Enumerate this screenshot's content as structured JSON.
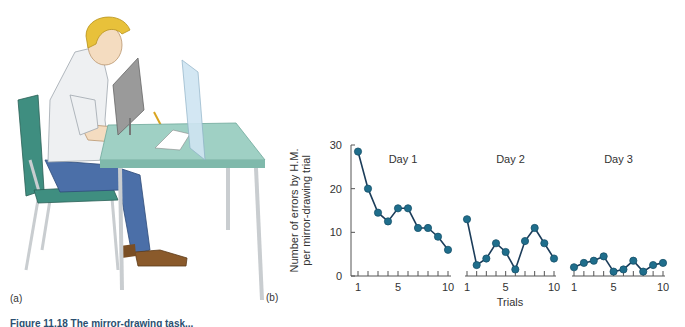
{
  "panels": {
    "a_label": "(a)",
    "b_label": "(b)"
  },
  "illustration": {
    "description": "Man seated at a table performing a mirror-drawing task behind a screen",
    "colors": {
      "table": "#9fd0c4",
      "table_edge": "#7fb9ab",
      "chair": "#3f8e80",
      "shirt": "#eef0f2",
      "pants": "#4b6fa8",
      "hair": "#e8c13a",
      "skin": "#f4dcc0",
      "shoes": "#8a5a2b",
      "screen": "#9a9a9a",
      "mirror": "#cfe5f2",
      "legs": "#c9cdd0"
    }
  },
  "chart_data": {
    "type": "line",
    "title": "",
    "xlabel": "Trials",
    "ylabel": "Number of errors by H.M. per mirror-drawing trial",
    "ylabel_lines": [
      "Number of errors by H.M.",
      "per mirror-drawing trial"
    ],
    "ylim": [
      0,
      30
    ],
    "yticks": [
      0,
      10,
      20,
      30
    ],
    "xticks_labeled": [
      1,
      5,
      10
    ],
    "grid": false,
    "legend": "none",
    "x": [
      1,
      2,
      3,
      4,
      5,
      6,
      7,
      8,
      9,
      10
    ],
    "series": [
      {
        "name": "Day 1",
        "values": [
          28.5,
          20,
          14.5,
          12.5,
          15.5,
          15.5,
          11,
          11,
          9,
          6
        ]
      },
      {
        "name": "Day 2",
        "values": [
          13,
          2.5,
          4,
          7.5,
          5.5,
          1.5,
          8,
          11,
          7.5,
          4
        ]
      },
      {
        "name": "Day 3",
        "values": [
          2,
          3,
          3.5,
          4.5,
          1,
          1.5,
          3.5,
          1,
          2.5,
          3
        ]
      }
    ],
    "colors": {
      "line": "#1c3d5a",
      "marker": "#1f6e8c",
      "axis": "#555555"
    }
  },
  "caption": {
    "text": "Figure 11.18 The mirror-drawing task..."
  }
}
